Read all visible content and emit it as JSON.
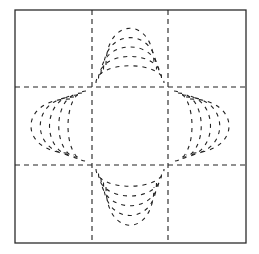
{
  "diagram": {
    "arms": [
      {
        "name": "top",
        "arc_count": 5,
        "opens_toward": "center"
      },
      {
        "name": "left",
        "arc_count": 5,
        "opens_toward": "center"
      },
      {
        "name": "right",
        "arc_count": 5,
        "opens_toward": "center"
      },
      {
        "name": "bottom",
        "arc_count": 5,
        "opens_toward": "center"
      }
    ],
    "colors": {
      "line": "#222222",
      "frame": "#2b2b2b",
      "background": "#ffffff"
    }
  }
}
